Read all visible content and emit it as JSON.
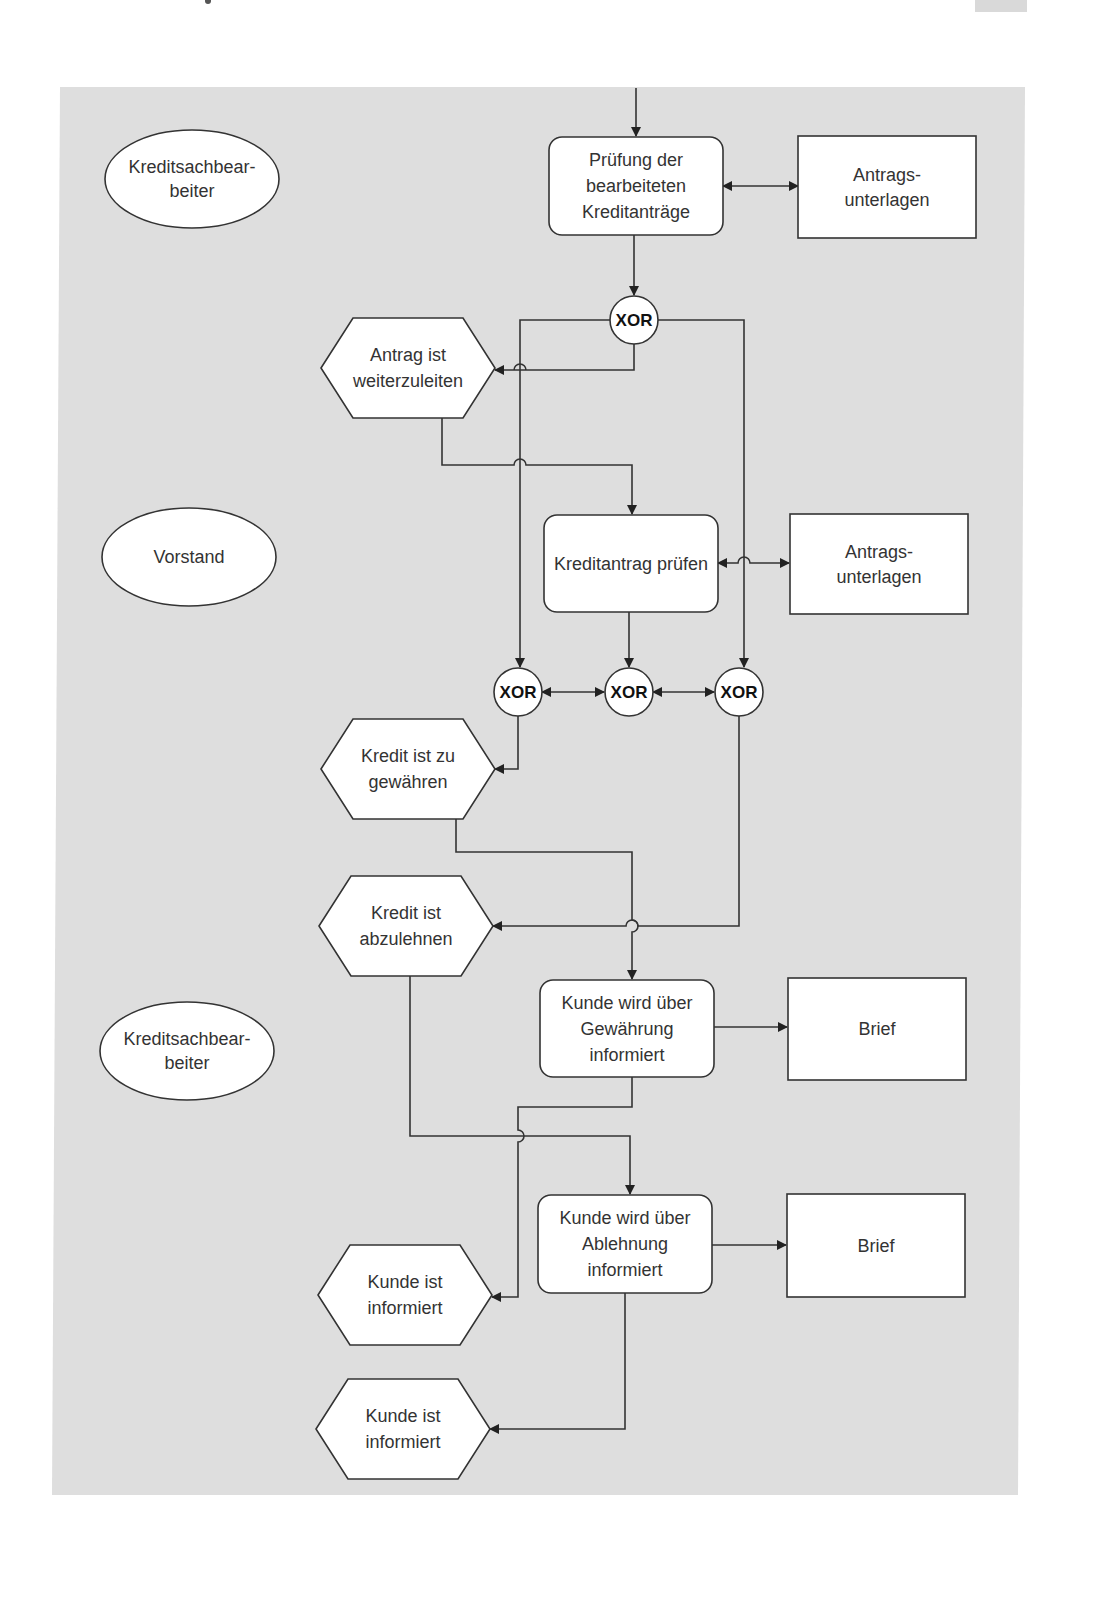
{
  "colors": {
    "panel_background": "#dedede",
    "shape_fill": "#ffffff",
    "stroke": "#333333",
    "text": "#333333"
  },
  "page": {
    "corner_tab_label": ""
  },
  "diagram": {
    "type": "EPK process flow (event-driven process chain)",
    "organizational_units": [
      {
        "id": "ou1",
        "shape": "ellipse",
        "lines": [
          "Kreditsachbear-",
          "beiter"
        ]
      },
      {
        "id": "ou2",
        "shape": "ellipse",
        "lines": [
          "Vorstand"
        ]
      },
      {
        "id": "ou3",
        "shape": "ellipse",
        "lines": [
          "Kreditsachbear-",
          "beiter"
        ]
      }
    ],
    "functions": [
      {
        "id": "f1",
        "shape": "rounded-rect",
        "lines": [
          "Prüfung der",
          "bearbeiteten",
          "Kreditanträge"
        ]
      },
      {
        "id": "f2",
        "shape": "rounded-rect",
        "lines": [
          "Kreditantrag prüfen"
        ]
      },
      {
        "id": "f3",
        "shape": "rounded-rect",
        "lines": [
          "Kunde wird über",
          "Gewährung",
          "informiert"
        ]
      },
      {
        "id": "f4",
        "shape": "rounded-rect",
        "lines": [
          "Kunde wird über",
          "Ablehnung",
          "informiert"
        ]
      }
    ],
    "information_objects": [
      {
        "id": "d1",
        "shape": "rect",
        "lines": [
          "Antrags-",
          "unterlagen"
        ]
      },
      {
        "id": "d2",
        "shape": "rect",
        "lines": [
          "Antrags-",
          "unterlagen"
        ]
      },
      {
        "id": "d3",
        "shape": "rect",
        "lines": [
          "Brief"
        ]
      },
      {
        "id": "d4",
        "shape": "rect",
        "lines": [
          "Brief"
        ]
      }
    ],
    "events": [
      {
        "id": "e1",
        "shape": "hexagon",
        "lines": [
          "Antrag ist",
          "weiterzuleiten"
        ]
      },
      {
        "id": "e2",
        "shape": "hexagon",
        "lines": [
          "Kredit ist zu",
          "gewähren"
        ]
      },
      {
        "id": "e3",
        "shape": "hexagon",
        "lines": [
          "Kredit ist",
          "abzulehnen"
        ]
      },
      {
        "id": "e4",
        "shape": "hexagon",
        "lines": [
          "Kunde ist",
          "informiert"
        ]
      },
      {
        "id": "e5",
        "shape": "hexagon",
        "lines": [
          "Kunde ist",
          "informiert"
        ]
      }
    ],
    "connectors": [
      {
        "id": "x1",
        "label": "XOR"
      },
      {
        "id": "x2",
        "label": "XOR"
      },
      {
        "id": "x3",
        "label": "XOR"
      },
      {
        "id": "x4",
        "label": "XOR"
      }
    ],
    "edges": [
      {
        "from": "incoming",
        "to": "f1"
      },
      {
        "from": "f1",
        "to": "d1",
        "bidirectional": true
      },
      {
        "from": "f1",
        "to": "x1"
      },
      {
        "from": "x1",
        "to": "e1"
      },
      {
        "from": "x1",
        "to": "x2"
      },
      {
        "from": "x1",
        "to": "x4"
      },
      {
        "from": "e1",
        "to": "f2"
      },
      {
        "from": "f2",
        "to": "d2",
        "bidirectional": true
      },
      {
        "from": "f2",
        "to": "x3"
      },
      {
        "from": "x2",
        "to": "x3",
        "bidirectional": true
      },
      {
        "from": "x3",
        "to": "x4",
        "bidirectional": true
      },
      {
        "from": "x2",
        "to": "e2"
      },
      {
        "from": "x4",
        "to": "e3"
      },
      {
        "from": "e2",
        "to": "f3"
      },
      {
        "from": "f3",
        "to": "d3"
      },
      {
        "from": "f3",
        "to": "e4"
      },
      {
        "from": "e3",
        "to": "f4"
      },
      {
        "from": "f4",
        "to": "d4"
      },
      {
        "from": "f4",
        "to": "e5"
      }
    ]
  }
}
